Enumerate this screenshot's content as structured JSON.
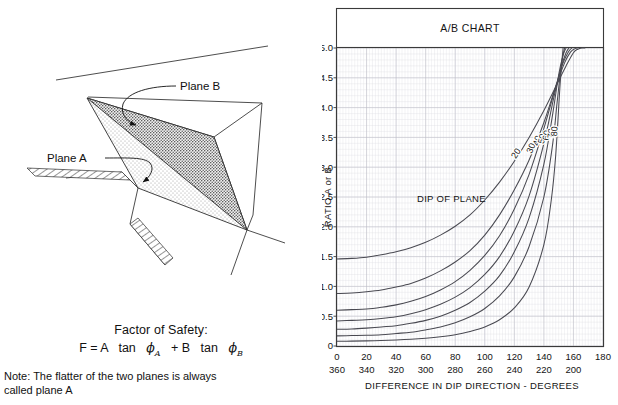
{
  "diagram": {
    "plane_b_label": "Plane B",
    "plane_a_label": "Plane A",
    "factor_of_safety_title": "Factor of Safety:",
    "formula_prefix": "F = A",
    "formula_tan1": "tan",
    "formula_phi1": "ϕ",
    "formula_sub1": "A",
    "formula_plus": "+ B",
    "formula_tan2": "tan",
    "formula_phi2": "ϕ",
    "formula_sub2": "B",
    "note_line1": "Note: The flatter of the two planes is always",
    "note_line2": "called plane A"
  },
  "chart_data": {
    "type": "line",
    "title": "A/B CHART",
    "xlabel": "DIFFERENCE IN DIP DIRECTION - DEGREES",
    "ylabel": "RATIO A or B",
    "annotation": "DIP OF PLANE",
    "xlim": [
      0,
      180
    ],
    "ylim": [
      0,
      5.0
    ],
    "grid": true,
    "legend_position": "inline-curve-labels",
    "x_ticks_primary": [
      0,
      20,
      40,
      60,
      80,
      100,
      120,
      140,
      160,
      180
    ],
    "x_ticks_secondary": [
      360,
      340,
      320,
      300,
      280,
      260,
      240,
      220,
      200
    ],
    "y_ticks": [
      0,
      0.5,
      1.0,
      1.5,
      2.0,
      2.5,
      3.0,
      3.5,
      4.0,
      4.5,
      5.0
    ],
    "series": [
      {
        "name": "20",
        "label": "20",
        "x": [
          0,
          10,
          20,
          30,
          40,
          50,
          60,
          70,
          80,
          90,
          100,
          110,
          120,
          130,
          140,
          150,
          155,
          160,
          163,
          166,
          168
        ],
        "values": [
          1.46,
          1.47,
          1.49,
          1.53,
          1.58,
          1.65,
          1.74,
          1.86,
          2.01,
          2.2,
          2.45,
          2.75,
          3.1,
          3.5,
          3.95,
          4.45,
          4.7,
          4.92,
          4.98,
          5.0,
          5.0
        ]
      },
      {
        "name": "30",
        "label": "30",
        "x": [
          0,
          10,
          20,
          30,
          40,
          50,
          60,
          70,
          80,
          90,
          100,
          110,
          120,
          130,
          140,
          148,
          154,
          158,
          161,
          163
        ],
        "values": [
          0.88,
          0.89,
          0.91,
          0.94,
          0.99,
          1.05,
          1.14,
          1.26,
          1.41,
          1.6,
          1.86,
          2.2,
          2.62,
          3.12,
          3.75,
          4.35,
          4.75,
          4.93,
          4.99,
          5.0
        ]
      },
      {
        "name": "40",
        "label": "40",
        "x": [
          0,
          10,
          20,
          30,
          40,
          50,
          60,
          70,
          80,
          90,
          100,
          110,
          120,
          130,
          140,
          148,
          153,
          157,
          159
        ],
        "values": [
          0.6,
          0.61,
          0.62,
          0.65,
          0.69,
          0.75,
          0.83,
          0.94,
          1.08,
          1.27,
          1.52,
          1.85,
          2.3,
          2.88,
          3.65,
          4.35,
          4.75,
          4.95,
          5.0
        ]
      },
      {
        "name": "50",
        "label": "50",
        "x": [
          0,
          10,
          20,
          30,
          40,
          50,
          60,
          70,
          80,
          90,
          100,
          110,
          120,
          130,
          140,
          147,
          152,
          155,
          157
        ],
        "values": [
          0.42,
          0.43,
          0.44,
          0.46,
          0.49,
          0.54,
          0.61,
          0.7,
          0.82,
          0.98,
          1.2,
          1.5,
          1.93,
          2.52,
          3.4,
          4.2,
          4.7,
          4.92,
          5.0
        ]
      },
      {
        "name": "60",
        "label": "60",
        "x": [
          0,
          10,
          20,
          30,
          40,
          50,
          60,
          70,
          80,
          90,
          100,
          110,
          120,
          130,
          140,
          146,
          150,
          153,
          155
        ],
        "values": [
          0.28,
          0.285,
          0.3,
          0.32,
          0.34,
          0.38,
          0.43,
          0.5,
          0.6,
          0.73,
          0.92,
          1.18,
          1.58,
          2.15,
          3.05,
          3.9,
          4.55,
          4.88,
          5.0
        ]
      },
      {
        "name": "70",
        "label": "70",
        "x": [
          0,
          10,
          20,
          30,
          40,
          50,
          60,
          70,
          80,
          90,
          100,
          110,
          120,
          130,
          140,
          146,
          149,
          152,
          154
        ],
        "values": [
          0.17,
          0.175,
          0.18,
          0.19,
          0.21,
          0.23,
          0.27,
          0.32,
          0.39,
          0.49,
          0.63,
          0.84,
          1.16,
          1.67,
          2.5,
          3.4,
          4.1,
          4.75,
          5.0
        ]
      },
      {
        "name": "80",
        "label": "80",
        "x": [
          0,
          10,
          20,
          30,
          40,
          50,
          60,
          70,
          80,
          90,
          100,
          110,
          120,
          130,
          140,
          145,
          148,
          151,
          153
        ],
        "values": [
          0.08,
          0.082,
          0.086,
          0.092,
          0.1,
          0.112,
          0.13,
          0.155,
          0.19,
          0.245,
          0.32,
          0.44,
          0.64,
          0.99,
          1.7,
          2.45,
          3.2,
          4.4,
          5.0
        ]
      }
    ]
  }
}
